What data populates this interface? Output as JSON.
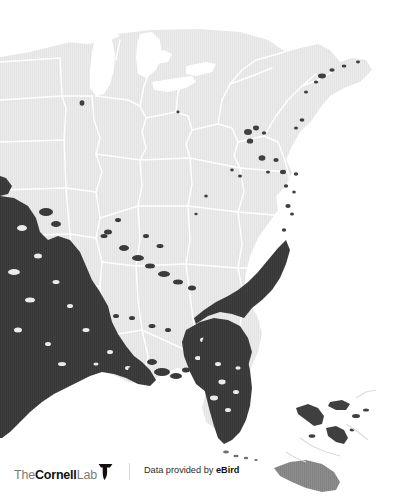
{
  "figure": {
    "kind": "species-range-map",
    "width": 414,
    "height": 502
  },
  "map": {
    "background_color": "#ffffff",
    "land_color": "#ebebeb",
    "land_texture": "vertical-hatch",
    "water_color": "#ffffff",
    "boundary_color": "#ffffff",
    "range_color": "#3f3f3f",
    "range_secondary_color": "#6e6e6e",
    "regions": [
      "Great Lakes",
      "Gulf of Mexico",
      "Atlantic Ocean",
      "Florida Peninsula",
      "Bahamas",
      "Cuba"
    ]
  },
  "footer": {
    "logo": {
      "the": "The",
      "cornell": "Cornell",
      "lab": "Lab",
      "icon": "bird-icon"
    },
    "divider": true,
    "attribution_prefix": "Data provided by ",
    "attribution_source": "eBird"
  }
}
